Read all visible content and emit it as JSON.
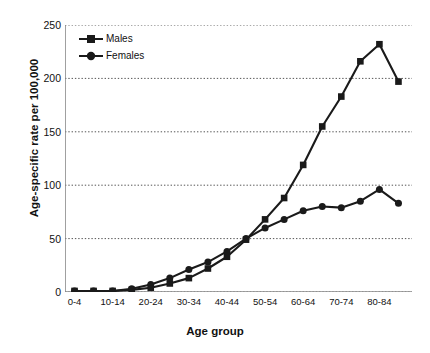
{
  "chart_data": {
    "type": "line",
    "title": "",
    "xlabel": "Age group",
    "ylabel": "Age-specific rate per 100,000",
    "ylim": [
      0,
      250
    ],
    "yticks": [
      0,
      50,
      100,
      150,
      200,
      250
    ],
    "grid": true,
    "legend_position": "top-left",
    "categories": [
      "0-4",
      "5-9",
      "10-14",
      "15-19",
      "20-24",
      "25-29",
      "30-34",
      "35-39",
      "40-44",
      "45-49",
      "50-54",
      "55-59",
      "60-64",
      "65-69",
      "70-74",
      "75-79",
      "80-84",
      "85+"
    ],
    "tick_labels_shown": [
      "0-4",
      "",
      "10-14",
      "",
      "20-24",
      "",
      "30-34",
      "",
      "40-44",
      "",
      "50-54",
      "",
      "60-64",
      "",
      "70-74",
      "",
      "80-84",
      ""
    ],
    "series": [
      {
        "name": "Males",
        "marker": "square",
        "color": "#1a1a1a",
        "values": [
          1,
          1,
          1,
          2,
          4,
          8,
          13,
          22,
          33,
          49,
          68,
          88,
          119,
          155,
          183,
          216,
          232,
          197
        ]
      },
      {
        "name": "Females",
        "marker": "circle",
        "color": "#1a1a1a",
        "values": [
          1,
          1,
          1,
          3,
          7,
          13,
          21,
          28,
          38,
          50,
          60,
          68,
          76,
          80,
          79,
          85,
          96,
          83
        ]
      }
    ]
  },
  "legend": {
    "items": [
      {
        "label": "Males"
      },
      {
        "label": "Females"
      }
    ]
  },
  "axes": {
    "x_title": "Age group",
    "y_title": "Age-specific rate per 100,000"
  },
  "colors": {
    "series": "#1a1a1a",
    "axis": "#888888",
    "grid": "#555555",
    "text": "#111111",
    "background": "#ffffff"
  }
}
